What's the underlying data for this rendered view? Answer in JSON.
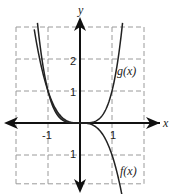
{
  "chart_data": {
    "type": "line",
    "title": "",
    "xlabel": "x",
    "ylabel": "y",
    "xlim": [
      -2,
      2
    ],
    "ylim": [
      -1.6,
      3
    ],
    "grid": true,
    "grid_style": "dashed",
    "x_ticks": [
      {
        "value": -1,
        "label": "-1"
      },
      {
        "value": 1,
        "label": "1"
      }
    ],
    "y_ticks": [
      {
        "value": 2,
        "label": "2"
      },
      {
        "value": 1,
        "label": "1"
      },
      {
        "value": -1,
        "label": "1"
      }
    ],
    "series": [
      {
        "name": "f(x)",
        "label": "f(x)",
        "expression": "-x^3",
        "x": [
          -1.15,
          -1,
          -0.5,
          0,
          0.5,
          1,
          1.15
        ],
        "y": [
          1.52,
          1,
          0.125,
          0,
          -0.125,
          -1,
          -1.52
        ]
      },
      {
        "name": "g(x)",
        "label": "g(x)",
        "expression": "x^4",
        "x": [
          -1.3,
          -1,
          -0.5,
          0,
          0.5,
          1,
          1.3
        ],
        "y": [
          2.86,
          1,
          0.0625,
          0,
          0.0625,
          1,
          2.86
        ]
      }
    ],
    "shaded_region": {
      "between": [
        "f(x)",
        "g(x)"
      ],
      "x_from": -1,
      "x_to": 0,
      "color": "#555555"
    },
    "legend": "inline labels"
  },
  "labels": {
    "x_axis": "x",
    "y_axis": "y",
    "f_label": "f(x)",
    "g_label": "g(x)",
    "tick_x_neg1": "-1",
    "tick_x_1": "1",
    "tick_y_2": "2",
    "tick_y_1": "1",
    "tick_y_neg1": "1"
  }
}
